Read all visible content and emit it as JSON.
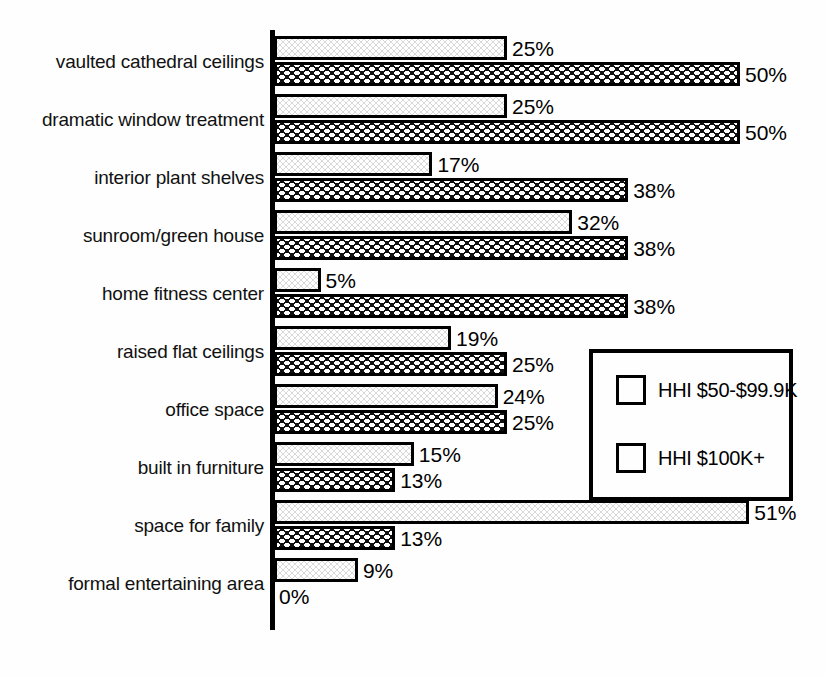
{
  "chart_data": {
    "type": "bar",
    "orientation": "horizontal",
    "title": "",
    "subtitle": "",
    "xlabel": "",
    "ylabel": "",
    "grid": false,
    "xlim": [
      0,
      51
    ],
    "value_suffix": "%",
    "legend_position": "center-right",
    "categories": [
      "vaulted cathedral ceilings",
      "dramatic window treatment",
      "interior plant shelves",
      "sunroom/green house",
      "home fitness center",
      "raised flat ceilings",
      "office space",
      "built in furniture",
      "space for family",
      "formal entertaining area"
    ],
    "series": [
      {
        "name": "HHI $50-$99.9K",
        "pattern": "light-dotted",
        "color": "#d9d9d9",
        "values": [
          25,
          25,
          17,
          32,
          5,
          19,
          24,
          15,
          51,
          9
        ],
        "labels": [
          "25%",
          "25%",
          "17%",
          "32%",
          "5%",
          "19%",
          "24%",
          "15%",
          "51%",
          "9%"
        ]
      },
      {
        "name": "HHI $100K+",
        "pattern": "dark-checkered",
        "color": "#111111",
        "values": [
          50,
          50,
          38,
          38,
          38,
          25,
          25,
          13,
          13,
          0
        ],
        "labels": [
          "50%",
          "50%",
          "38%",
          "38%",
          "38%",
          "25%",
          "25%",
          "13%",
          "13%",
          "0%"
        ]
      }
    ]
  },
  "legend": {
    "items": [
      {
        "label": "HHI $50-$99.9K",
        "pattern": "light-dotted"
      },
      {
        "label": "HHI $100K+",
        "pattern": "dark-checkered"
      }
    ]
  }
}
